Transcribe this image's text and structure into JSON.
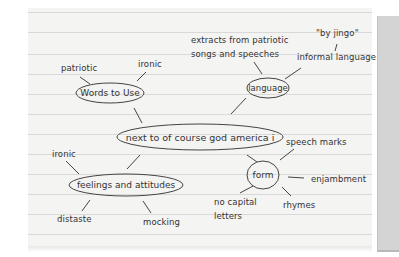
{
  "mindmap": {
    "central": "next to of course god america i",
    "nodes": {
      "words": {
        "label": "Words to Use",
        "children": [
          "patriotic",
          "ironic"
        ]
      },
      "language": {
        "label": "language",
        "children": [
          "extracts from patriotic",
          "songs and speeches",
          "\"by jingo\"",
          "informal language"
        ]
      },
      "feelings": {
        "label": "feelings and attitudes",
        "children": [
          "ironic",
          "distaste",
          "mocking"
        ]
      },
      "form": {
        "label": "form",
        "children": [
          "speech marks",
          "enjambment",
          "rhymes",
          "no capital",
          "letters"
        ]
      }
    }
  },
  "colors": {
    "paper": "#f4f4f3",
    "rule_line": "#d9d9d9",
    "ink": "#333333",
    "side_panel": "#d4d4d4"
  }
}
